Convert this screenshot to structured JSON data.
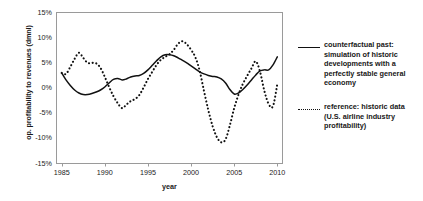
{
  "chart_data": {
    "type": "line",
    "title": "",
    "xlabel": "year",
    "ylabel": "op. profitability to revenues (dmnl)",
    "xlim": [
      1984.4,
      2010.6
    ],
    "ylim": [
      -15,
      15
    ],
    "grid": false,
    "legend_position": "right",
    "xticks": [
      1985,
      1990,
      1995,
      2000,
      2005,
      2010
    ],
    "xtick_labels": [
      "1985",
      "1990",
      "1995",
      "2000",
      "2005",
      "2010"
    ],
    "yticks": [
      15,
      10,
      5,
      0,
      -5,
      -10,
      -15
    ],
    "ytick_labels": [
      "15%",
      "10%",
      "5%",
      "0%",
      "-5%",
      "-10%",
      "-15%"
    ],
    "x": [
      1985,
      1985.5,
      1986,
      1986.5,
      1987,
      1987.5,
      1988,
      1988.5,
      1989,
      1989.5,
      1990,
      1990.5,
      1991,
      1991.5,
      1992,
      1992.5,
      1993,
      1993.5,
      1994,
      1994.5,
      1995,
      1995.5,
      1996,
      1996.5,
      1997,
      1997.5,
      1998,
      1998.5,
      1999,
      1999.5,
      2000,
      2000.5,
      2001,
      2001.5,
      2002,
      2002.5,
      2003,
      2003.5,
      2004,
      2004.5,
      2005,
      2005.5,
      2006,
      2006.5,
      2007,
      2007.5,
      2008,
      2008.5,
      2009,
      2009.5,
      2010
    ],
    "series": [
      {
        "name": "counterfactual past: simulation of historic developments with a perfectly stable general economy",
        "style": "solid",
        "values": [
          3.0,
          1.6,
          0.5,
          -0.4,
          -1.0,
          -1.3,
          -1.3,
          -1.1,
          -0.8,
          -0.4,
          0.2,
          1.0,
          1.7,
          1.9,
          1.6,
          1.8,
          2.2,
          2.4,
          2.5,
          2.9,
          3.6,
          4.5,
          5.4,
          6.2,
          6.6,
          6.6,
          6.4,
          6.0,
          5.5,
          5.0,
          4.4,
          3.8,
          3.2,
          2.8,
          2.5,
          2.3,
          2.2,
          1.8,
          1.0,
          -0.3,
          -1.2,
          -1.0,
          -0.3,
          0.6,
          1.6,
          2.6,
          3.4,
          3.6,
          3.6,
          4.6,
          6.2
        ]
      },
      {
        "name": "reference: historic data (U.S. airline industry profitability)",
        "style": "dotted",
        "values": [
          3.0,
          2.8,
          4.2,
          5.8,
          7.0,
          6.0,
          5.0,
          5.0,
          4.9,
          4.0,
          2.2,
          0.2,
          -1.6,
          -3.0,
          -4.0,
          -3.3,
          -2.6,
          -2.2,
          -1.4,
          0.1,
          1.8,
          3.2,
          4.6,
          5.6,
          6.2,
          6.7,
          7.6,
          8.8,
          9.3,
          8.7,
          7.6,
          6.1,
          3.4,
          -0.6,
          -4.4,
          -7.6,
          -9.8,
          -10.8,
          -10.2,
          -7.4,
          -4.0,
          -1.3,
          0.8,
          2.4,
          3.9,
          5.3,
          3.2,
          -0.6,
          -3.2,
          -3.6,
          0.8
        ]
      }
    ]
  },
  "legend": {
    "entries": [
      {
        "marker": "solid-line-sample",
        "label": "counterfactual past: simulation of historic developments with a perfectly stable general economy"
      },
      {
        "marker": "dotted-line-sample",
        "label": "reference: historic data (U.S. airline industry profitability)"
      }
    ]
  }
}
